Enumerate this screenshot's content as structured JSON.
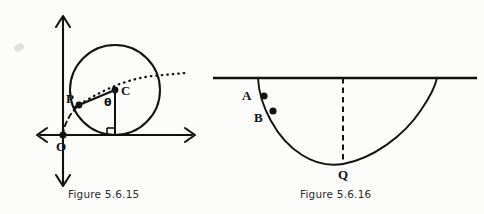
{
  "page": {
    "background_color": "#fcfcfa",
    "ink_color": "#111111",
    "width": 484,
    "height": 214
  },
  "figures": [
    {
      "id": "figure-5-6-15",
      "caption": "Figure 5.6.15",
      "description": "Circle of radius r tangent to the x-axis with centre C, a point P on the circle, the angle theta at C, and the origin O of the coordinate axes; a dashed cycloid arc passes through O and P and a dotted line continues from P past C to the right.",
      "labels": [
        {
          "name": "P",
          "text": "P",
          "x": 66,
          "y": 92
        },
        {
          "name": "C",
          "text": "C",
          "x": 121,
          "y": 84
        },
        {
          "name": "theta",
          "text": "θ",
          "x": 104,
          "y": 97
        },
        {
          "name": "O",
          "text": "O",
          "x": 56,
          "y": 140
        }
      ],
      "geometry": {
        "axes": {
          "x_axis_y": 135,
          "y_axis_x": 63,
          "x_from": 36,
          "x_to": 196,
          "y_from": 14,
          "y_to": 188
        },
        "circle": {
          "cx": 115,
          "cy": 90,
          "r": 45
        },
        "point_C": {
          "x": 115,
          "y": 90
        },
        "point_P": {
          "x": 79,
          "y": 105
        },
        "point_O": {
          "x": 63,
          "y": 135
        },
        "right_angle_at": {
          "x": 115,
          "y": 135
        }
      }
    },
    {
      "id": "figure-5-6-16",
      "caption": "Figure 5.6.16",
      "description": "A cycloid arc hanging below a horizontal line, with marked points A and B on the upper left part of the curve and the lowest point Q joined to the line by a dashed vertical segment.",
      "labels": [
        {
          "name": "A",
          "text": "A",
          "x": 242,
          "y": 89
        },
        {
          "name": "B",
          "text": "B",
          "x": 254,
          "y": 111
        },
        {
          "name": "Q",
          "text": "Q",
          "x": 338,
          "y": 168
        }
      ],
      "geometry": {
        "horizontal_line": {
          "y": 78,
          "x_from": 213,
          "x_to": 477
        },
        "arc_start": {
          "x": 258,
          "y": 78
        },
        "arc_end": {
          "x": 437,
          "y": 78
        },
        "point_A": {
          "x": 264,
          "y": 96
        },
        "point_B": {
          "x": 273,
          "y": 111
        },
        "point_Q": {
          "x": 343,
          "y": 164
        },
        "dashed_vertical": {
          "x": 343,
          "y_from": 78,
          "y_to": 164
        }
      }
    }
  ]
}
